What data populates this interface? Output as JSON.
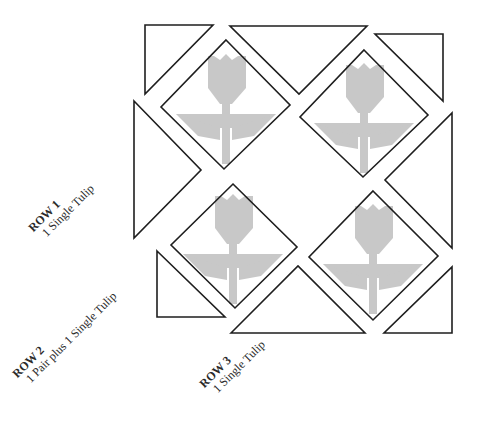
{
  "diagram": {
    "colors": {
      "outline": "#1e1e1e",
      "tulip": "#c8c8c8",
      "background": "#ffffff"
    },
    "rows": [
      {
        "label": "ROW 1",
        "description": "1 Single Tulip"
      },
      {
        "label": "ROW 2",
        "description": "1 Pair plus 1 Single Tulip"
      },
      {
        "label": "ROW 3",
        "description": "1 Single Tulip"
      }
    ],
    "tulip_blocks": [
      {
        "name": "tulip-block-top-left",
        "row": 2
      },
      {
        "name": "tulip-block-top-right",
        "row": 1
      },
      {
        "name": "tulip-block-bottom-left",
        "row": 3
      },
      {
        "name": "tulip-block-bottom-right",
        "row": 2
      }
    ],
    "setting_triangles": 8
  }
}
